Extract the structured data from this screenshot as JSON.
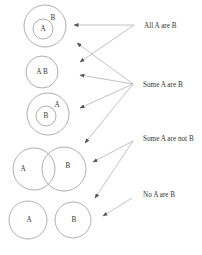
{
  "diagram": {
    "colors": {
      "circle_stroke": "#9a9a9a",
      "arrow_stroke": "#a8a8a8",
      "text": "#333333",
      "background": "#ffffff"
    },
    "labels": [
      {
        "id": "all",
        "text": "All A are B",
        "x": 144,
        "y": 28
      },
      {
        "id": "some",
        "text": "Some A are B",
        "x": 143,
        "y": 87
      },
      {
        "id": "some_not",
        "text": "Some A are not B",
        "x": 143,
        "y": 141
      },
      {
        "id": "none",
        "text": "No A are B",
        "x": 143,
        "y": 197
      }
    ],
    "figures": [
      {
        "name": "A-inside-B",
        "circles": [
          {
            "cx": 45,
            "cy": 26,
            "r": 21,
            "label": "B",
            "lx": 53,
            "ly": 20
          },
          {
            "cx": 43,
            "cy": 29,
            "r": 10,
            "label": "A",
            "lx": 43,
            "ly": 31
          }
        ]
      },
      {
        "name": "A-equals-B",
        "circles": [
          {
            "cx": 42,
            "cy": 72,
            "r": 16,
            "label": "A B",
            "lx": 42,
            "ly": 74
          }
        ]
      },
      {
        "name": "B-inside-A",
        "circles": [
          {
            "cx": 48,
            "cy": 114,
            "r": 21,
            "label": "A",
            "lx": 57,
            "ly": 107
          },
          {
            "cx": 46,
            "cy": 116,
            "r": 10,
            "label": "B",
            "lx": 46,
            "ly": 118
          }
        ]
      },
      {
        "name": "A-overlaps-B",
        "circles": [
          {
            "cx": 34,
            "cy": 169,
            "r": 21,
            "label": "A",
            "lx": 23,
            "ly": 171
          },
          {
            "cx": 64,
            "cy": 169,
            "r": 22,
            "label": "B",
            "lx": 68,
            "ly": 168
          }
        ]
      },
      {
        "name": "A-disjoint-B",
        "circles": [
          {
            "cx": 28,
            "cy": 220,
            "r": 19,
            "label": "A",
            "lx": 29,
            "ly": 222
          },
          {
            "cx": 73,
            "cy": 220,
            "r": 18,
            "label": "B",
            "lx": 74,
            "ly": 222
          }
        ]
      }
    ],
    "arrows": [
      {
        "from": "all",
        "x1": 134,
        "y1": 25,
        "x2": 74,
        "y2": 25
      },
      {
        "from": "all",
        "x1": 134,
        "y1": 25,
        "x2": 80,
        "y2": 62
      },
      {
        "from": "some",
        "x1": 133,
        "y1": 84,
        "x2": 77,
        "y2": 43
      },
      {
        "from": "some",
        "x1": 133,
        "y1": 84,
        "x2": 80,
        "y2": 75
      },
      {
        "from": "some",
        "x1": 133,
        "y1": 84,
        "x2": 80,
        "y2": 108
      },
      {
        "from": "some",
        "x1": 133,
        "y1": 84,
        "x2": 85,
        "y2": 143
      },
      {
        "from": "some_not",
        "x1": 133,
        "y1": 141,
        "x2": 93,
        "y2": 162
      },
      {
        "from": "some_not",
        "x1": 133,
        "y1": 141,
        "x2": 95,
        "y2": 198
      },
      {
        "from": "none",
        "x1": 132,
        "y1": 198,
        "x2": 103,
        "y2": 216
      }
    ]
  }
}
